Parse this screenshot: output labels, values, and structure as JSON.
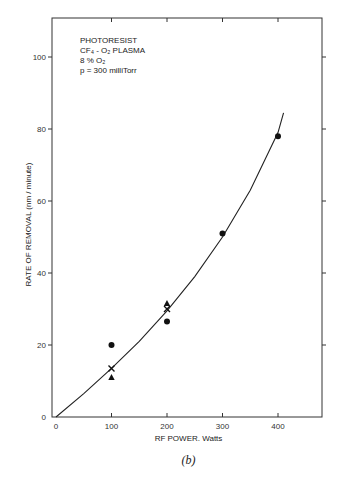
{
  "chart_data": {
    "type": "scatter",
    "title": "",
    "subtitle": "",
    "caption": "(b)",
    "xlabel": "RF POWER, Watts",
    "ylabel": "RATE OF REMOVAL  (nm / minute)",
    "xlim": [
      0,
      480
    ],
    "ylim": [
      0,
      110
    ],
    "x_ticks": [
      0,
      100,
      200,
      300,
      400
    ],
    "y_ticks": [
      0,
      20,
      40,
      60,
      80,
      100
    ],
    "grid": false,
    "annotations": [
      "PHOTORESIST",
      "CF4 - O2  PLASMA",
      "8 % O2",
      "p = 300 milliTorr"
    ],
    "series": [
      {
        "name": "circles",
        "marker": "circle",
        "points": [
          [
            100,
            20
          ],
          [
            200,
            26.5
          ],
          [
            300,
            51
          ],
          [
            400,
            78
          ]
        ]
      },
      {
        "name": "triangles",
        "marker": "triangle",
        "points": [
          [
            100,
            11
          ],
          [
            200,
            31.5
          ]
        ]
      },
      {
        "name": "crosses",
        "marker": "cross",
        "points": [
          [
            100,
            13.5
          ],
          [
            200,
            30
          ]
        ]
      }
    ],
    "fit_curve": {
      "name": "fit",
      "type": "line",
      "points": [
        [
          0,
          0
        ],
        [
          50,
          6.5
        ],
        [
          100,
          13.5
        ],
        [
          150,
          21
        ],
        [
          200,
          29.5
        ],
        [
          250,
          39
        ],
        [
          300,
          50
        ],
        [
          350,
          63
        ],
        [
          400,
          79
        ],
        [
          410,
          84.5
        ]
      ]
    }
  },
  "labels": {
    "annotation_lines": [
      "PHOTORESIST",
      "CF₄ - O₂  PLASMA",
      "8 %  O₂",
      "p = 300 milliTorr"
    ],
    "xlabel": "RF POWER. Watts",
    "ylabel": "RATE OF REMOVAL  (nm / minute)",
    "caption": "(b)"
  }
}
